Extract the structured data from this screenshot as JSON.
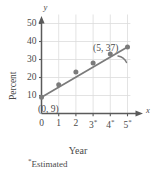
{
  "figure": {
    "name": "percent-vs-year-scatter-with-trend-line",
    "footnote": "Estimated",
    "footnote_marker": "*"
  },
  "chart_data": {
    "type": "scatter",
    "title": "",
    "subtitle": "",
    "xlabel": "Year",
    "ylabel": "Percent",
    "x_axis_letter": "x",
    "y_axis_letter": "y",
    "xlim": [
      0,
      5.4
    ],
    "ylim": [
      0,
      55
    ],
    "grid": true,
    "legend": null,
    "x_tick_labels": [
      "0",
      "1",
      "2",
      "3",
      "4",
      "5"
    ],
    "x_tick_values": [
      0,
      1,
      2,
      3,
      4,
      5
    ],
    "x_tick_estimated_flags": [
      false,
      false,
      false,
      true,
      true,
      true
    ],
    "y_tick_labels": [
      "10",
      "20",
      "30",
      "40",
      "50"
    ],
    "y_tick_values": [
      10,
      20,
      30,
      40,
      50
    ],
    "series": [
      {
        "name": "Percent",
        "marker": "circle",
        "color": "#7b7b7b",
        "x": [
          0,
          1,
          2,
          3,
          4,
          5
        ],
        "values": [
          9,
          16,
          23,
          28,
          33,
          37
        ]
      },
      {
        "name": "trend line",
        "type": "line",
        "color": "#7b7b7b",
        "x": [
          0,
          5
        ],
        "values": [
          9,
          37
        ]
      }
    ],
    "annotations": [
      {
        "label": "(0, 9)",
        "x": 0,
        "y": 9
      },
      {
        "label": "(5, 37)",
        "x": 5,
        "y": 37
      }
    ]
  },
  "colors": {
    "data": "#7b7b7b",
    "axis": "#5a5a5a",
    "grid": "#dcdcdc",
    "text": "#4a4a4a",
    "background": "#ffffff"
  }
}
